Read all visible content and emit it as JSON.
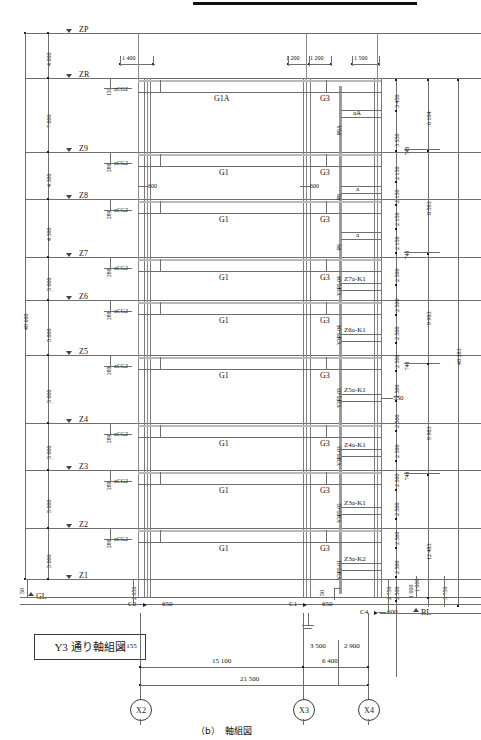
{
  "sheet": {
    "title_box": "Y3 通り軸組図",
    "figure_caption": "（b）　軸組図",
    "overall_height_left": "49 600",
    "overall_height_right": "48 383",
    "base_line_label": "BL",
    "ground_line_label": "GL"
  },
  "levels": [
    {
      "name": "ZP",
      "y": 33,
      "gap_below": "4 000",
      "offset": ""
    },
    {
      "name": "ZR",
      "y": 78,
      "gap_below": "7 000",
      "offset": "150"
    },
    {
      "name": "Z9",
      "y": 152,
      "gap_below": "4 300",
      "offset": "280"
    },
    {
      "name": "Z8",
      "y": 199,
      "gap_below": "4 300",
      "offset": "280"
    },
    {
      "name": "Z7",
      "y": 257,
      "gap_below": "5 000",
      "offset": "280"
    },
    {
      "name": "Z6",
      "y": 300,
      "gap_below": "5 000",
      "offset": "280"
    },
    {
      "name": "Z5",
      "y": 355,
      "gap_below": "5 000",
      "offset": "280"
    },
    {
      "name": "Z4",
      "y": 423,
      "gap_below": "5 000",
      "offset": "280"
    },
    {
      "name": "Z3",
      "y": 470,
      "gap_below": "5 000",
      "offset": "280"
    },
    {
      "name": "Z2",
      "y": 528,
      "gap_below": "5 000",
      "offset": "280"
    },
    {
      "name": "Z1",
      "y": 579,
      "gap_below": "",
      "offset": ""
    }
  ],
  "left_vertical_dims": [
    "4 000",
    "7 000",
    "4 300",
    "4 300",
    "5 000",
    "5 000",
    "5 000",
    "5 000",
    "5 000",
    "5 000"
  ],
  "left_small_dims": {
    "gl_to_z1": "50",
    "z1_to_c2": "2 050"
  },
  "top_dims": {
    "left_span": "1 400",
    "mid_a": "1 200",
    "mid_b": "1 200",
    "right": "1 500"
  },
  "beams_left": [
    {
      "label": "G1A",
      "level": "ZR"
    },
    {
      "label": "G1",
      "level": "Z9"
    },
    {
      "label": "G1",
      "level": "Z8"
    },
    {
      "label": "G1",
      "level": "Z7"
    },
    {
      "label": "G1",
      "level": "Z6"
    },
    {
      "label": "G1",
      "level": "Z5"
    },
    {
      "label": "G1",
      "level": "Z4"
    },
    {
      "label": "G1",
      "level": "Z3"
    },
    {
      "label": "G1",
      "level": "Z2"
    }
  ],
  "beams_right": [
    "G3",
    "G3",
    "G3",
    "G3",
    "G3",
    "G3",
    "G3",
    "G3",
    "G3"
  ],
  "column_tags_left": [
    "aCG2",
    "aCG2",
    "aCG2",
    "aCG2",
    "aCG2",
    "aCG2",
    "aCG2",
    "aCG2",
    "aCG2"
  ],
  "depth_marks": [
    "600",
    "600"
  ],
  "brace_labels_vertical": [
    "P9A",
    "P9",
    "P9",
    "Y3P5-04",
    "Y3P5-04",
    "Y3P5-03",
    "Y3P5-03",
    "Y3P5-02",
    "Y3P5-01"
  ],
  "panel_labels": [
    "aA",
    "a",
    "a",
    "Z7a-K1",
    "Z6a-K1",
    "Z5a-K1",
    "Z4a-K1",
    "Z3a-K1",
    "Z3a-K2"
  ],
  "misc_dims": {
    "d550": "550",
    "d50": "50",
    "d650_a": "650",
    "d650_b": "650",
    "d600": "600",
    "d2750": "2 750",
    "d1000": "1 000"
  },
  "footing_tags": [
    "C2",
    "C1",
    "C4"
  ],
  "right_dims": [
    "3 450",
    "3 550",
    "2 150",
    "2 150",
    "2 150",
    "2 150",
    "2 500",
    "2 500",
    "2 500",
    "2 500",
    "2 500",
    "2 500",
    "2 500",
    "2 500",
    "2 500",
    "2 500",
    "2 500",
    "2 500"
  ],
  "right_740": [
    "740",
    "740",
    "740",
    "740"
  ],
  "right_group_dims": [
    "6 104",
    "8 593",
    "9 983",
    "9 983",
    "12 483"
  ],
  "right_bottom_dims": {
    "d1000": "1 000",
    "d3750": "3 750"
  },
  "bottom_dims": {
    "left_offset": "2 155",
    "span_x2_x3": "15 100",
    "span_x3_x4": "6 400",
    "sub_a": "3 500",
    "sub_b": "2 900",
    "total": "21 500"
  },
  "grid_labels": [
    "X2",
    "X3",
    "X4"
  ]
}
